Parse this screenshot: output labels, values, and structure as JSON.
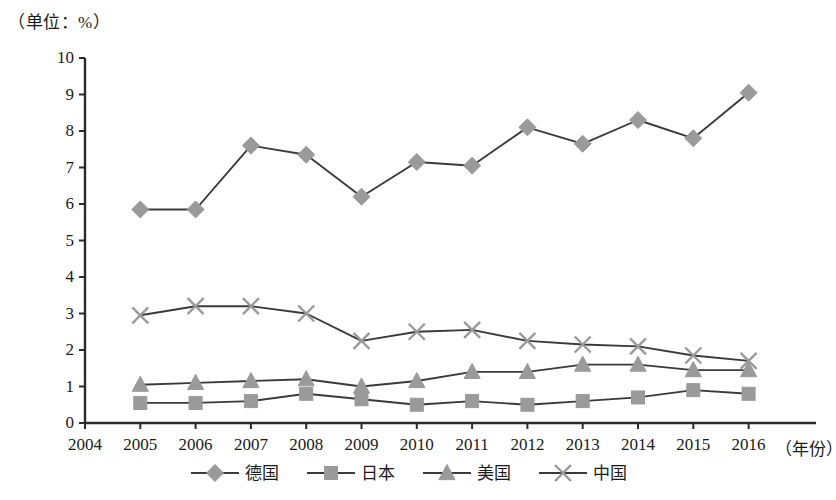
{
  "chart_data": {
    "type": "line",
    "title": "",
    "subtitle": "",
    "unit_note": "（单位：%）",
    "xlabel": "（年份）",
    "ylabel": "",
    "x": [
      2005,
      2006,
      2007,
      2008,
      2009,
      2010,
      2011,
      2012,
      2013,
      2014,
      2015,
      2016
    ],
    "xtick_labels": [
      "2004",
      "2005",
      "2006",
      "2007",
      "2008",
      "2009",
      "2010",
      "2011",
      "2012",
      "2013",
      "2014",
      "2015",
      "2016"
    ],
    "xlim": [
      2004,
      2016
    ],
    "ytick_labels": [
      "0",
      "1",
      "2",
      "3",
      "4",
      "5",
      "6",
      "7",
      "8",
      "9",
      "10"
    ],
    "ylim": [
      0,
      10
    ],
    "grid": false,
    "legend_position": "bottom",
    "series": [
      {
        "name": "德国",
        "marker": "diamond",
        "color": "#9a9a9a",
        "line_color": "#3a3a3a",
        "values": [
          5.85,
          5.85,
          7.6,
          7.35,
          6.2,
          7.15,
          7.05,
          8.1,
          7.65,
          8.3,
          7.8,
          9.05
        ]
      },
      {
        "name": "日本",
        "marker": "square",
        "color": "#9a9a9a",
        "line_color": "#3a3a3a",
        "values": [
          0.55,
          0.55,
          0.6,
          0.8,
          0.65,
          0.5,
          0.6,
          0.5,
          0.6,
          0.7,
          0.9,
          0.8
        ]
      },
      {
        "name": "美国",
        "marker": "triangle",
        "color": "#9a9a9a",
        "line_color": "#3a3a3a",
        "values": [
          1.05,
          1.1,
          1.15,
          1.2,
          1.0,
          1.15,
          1.4,
          1.4,
          1.6,
          1.6,
          1.45,
          1.45
        ]
      },
      {
        "name": "中国",
        "marker": "cross",
        "color": "#9a9a9a",
        "line_color": "#3a3a3a",
        "values": [
          2.95,
          3.2,
          3.2,
          3.0,
          2.25,
          2.5,
          2.55,
          2.25,
          2.15,
          2.1,
          1.85,
          1.7
        ]
      }
    ]
  },
  "axes": {
    "y_axis_color": "#2b2b2b",
    "x_axis_color": "#2b2b2b"
  }
}
